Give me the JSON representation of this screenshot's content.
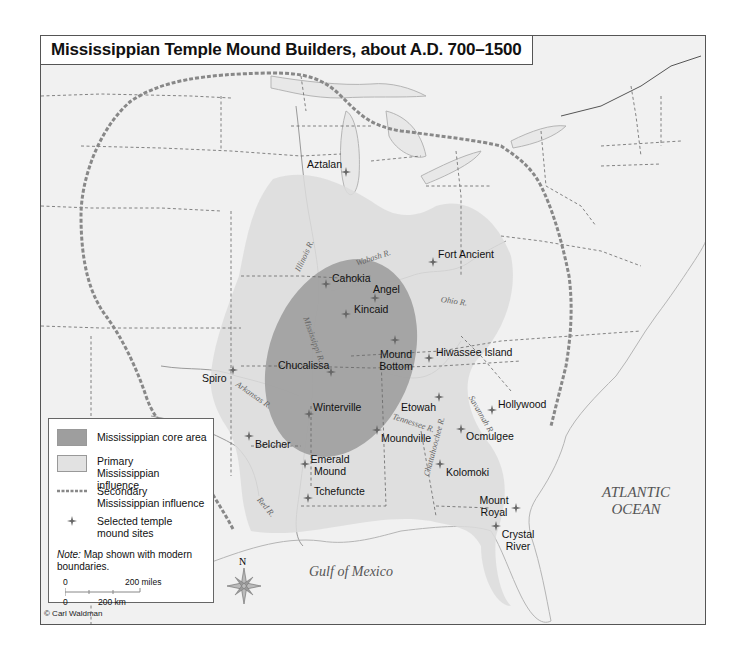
{
  "title": "Mississippian Temple Mound Builders, about A.D. 700–1500",
  "colors": {
    "core_area": "#9e9e9e",
    "primary_influence": "#dcdcdc",
    "secondary_influence_line": "#8a8a8a",
    "background": "#f1f1f1",
    "site_marker": "#666666"
  },
  "sites": [
    {
      "name": "Aztalan"
    },
    {
      "name": "Fort Ancient"
    },
    {
      "name": "Cahokia"
    },
    {
      "name": "Angel"
    },
    {
      "name": "Kincaid"
    },
    {
      "name": "Mound Bottom"
    },
    {
      "name": "Hiwassee Island"
    },
    {
      "name": "Spiro"
    },
    {
      "name": "Chucalissa"
    },
    {
      "name": "Etowah"
    },
    {
      "name": "Hollywood"
    },
    {
      "name": "Winterville"
    },
    {
      "name": "Moundville"
    },
    {
      "name": "Ocmulgee"
    },
    {
      "name": "Belcher"
    },
    {
      "name": "Emerald Mound"
    },
    {
      "name": "Kolomoki"
    },
    {
      "name": "Tchefuncte"
    },
    {
      "name": "Mount Royal"
    },
    {
      "name": "Crystal River"
    }
  ],
  "rivers": [
    {
      "name": "Illinois R."
    },
    {
      "name": "Wabash R."
    },
    {
      "name": "Ohio R."
    },
    {
      "name": "Mississippi R."
    },
    {
      "name": "Arkansas R."
    },
    {
      "name": "Tennessee R."
    },
    {
      "name": "Chattahoochee R."
    },
    {
      "name": "Savannah R."
    },
    {
      "name": "Red R."
    }
  ],
  "water_bodies": {
    "atlantic": "ATLANTIC OCEAN",
    "gulf": "Gulf of Mexico"
  },
  "legend": {
    "core": "Mississippian core area",
    "primary": "Primary Mississippian influence",
    "secondary": "Secondary Mississippian influence",
    "sites": "Selected temple mound sites",
    "note_label": "Note:",
    "note_text": "Map shown with modern boundaries.",
    "scale": {
      "miles_zero": "0",
      "miles_label": "200 miles",
      "km_zero": "0",
      "km_label": "200 km"
    }
  },
  "compass": {
    "north": "N"
  },
  "credit": "© Carl Waldman"
}
